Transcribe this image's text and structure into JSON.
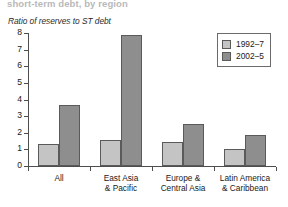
{
  "chart_data": {
    "type": "bar",
    "title": "short-term debt, by region",
    "subtitle": "Ratio of reserves to ST debt",
    "xlabel": "",
    "ylabel": "",
    "ylim": [
      0,
      8
    ],
    "yticks": [
      0,
      1,
      2,
      3,
      4,
      5,
      6,
      7,
      8
    ],
    "ytick_labels": [
      "0",
      "1",
      "2",
      "3",
      "4",
      "5",
      "6",
      "7",
      "8"
    ],
    "grid": false,
    "legend_position": "top-right",
    "categories": [
      "All",
      "East Asia\n& Pacific",
      "Europe &\nCentral Asia",
      "Latin America\n& Caribbean"
    ],
    "series": [
      {
        "name": "1992–7",
        "color": "#c4c4c4",
        "values": [
          1.3,
          1.55,
          1.45,
          1.05
        ]
      },
      {
        "name": "2002–5",
        "color": "#8e8e8e",
        "values": [
          3.7,
          7.9,
          2.55,
          1.85
        ]
      }
    ]
  },
  "legend": {
    "items": [
      {
        "label": "1992–7"
      },
      {
        "label": "2002–5"
      }
    ]
  }
}
